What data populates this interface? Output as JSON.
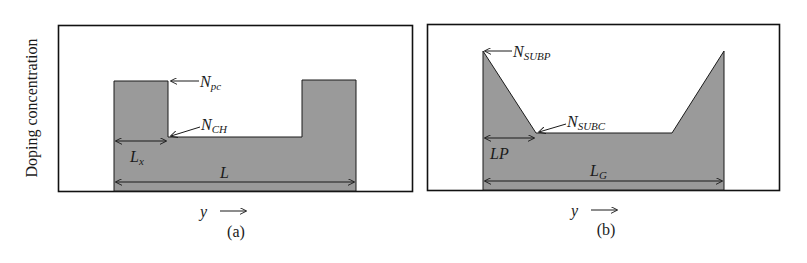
{
  "ylabel": "Doping concentration",
  "panels": [
    {
      "id": "a",
      "caption": "(a)",
      "xlabel": "y",
      "labels": {
        "peak": {
          "main": "N",
          "sub": "pc"
        },
        "channel": {
          "main": "N",
          "sub": "CH"
        },
        "pocket_length": {
          "main": "L",
          "sub": "x"
        },
        "total_length": {
          "main": "L",
          "sub": ""
        }
      }
    },
    {
      "id": "b",
      "caption": "(b)",
      "xlabel": "y",
      "labels": {
        "peak": {
          "main": "N",
          "sub": "SUBP"
        },
        "channel": {
          "main": "N",
          "sub": "SUBC"
        },
        "pocket_length": {
          "main": "LP",
          "sub": ""
        },
        "total_length": {
          "main": "L",
          "sub": "G"
        }
      }
    }
  ],
  "colors": {
    "fill": "#9a9a9a",
    "stroke": "#1a1a1a",
    "frame": "#111111"
  }
}
